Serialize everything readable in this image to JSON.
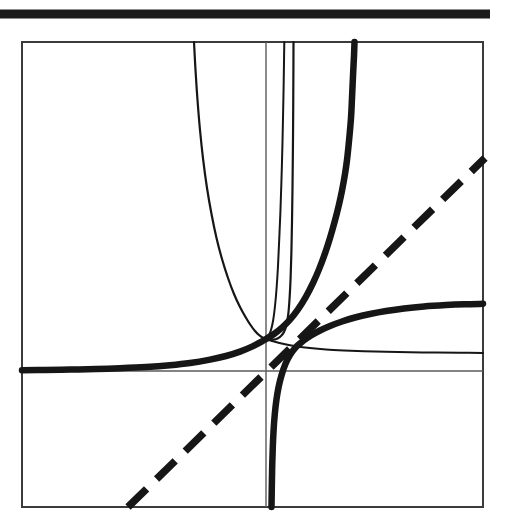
{
  "figure": {
    "title": "",
    "background_color": "#ffffff",
    "ink_color": "#161616",
    "axis_color": "#5a5a5a",
    "frame_color": "#3b3b3b",
    "top_rule": {
      "name": "top-rule",
      "x1": 0,
      "y1": 14,
      "x2": 490,
      "y2": 14,
      "stroke_width": 9,
      "color": "#1c1c1c"
    },
    "plot_frame": {
      "name": "plot-frame",
      "x": 22,
      "y": 42,
      "width": 461,
      "height": 465,
      "stroke_width": 2,
      "color": "#3b3b3b"
    },
    "axes": {
      "x_axis": {
        "y": 371,
        "x1": 22,
        "x2": 483,
        "stroke_width": 1.4,
        "color": "#5a5a5a"
      },
      "y_axis": {
        "x": 266,
        "y1": 42,
        "y2": 507,
        "stroke_width": 1.4,
        "color": "#5a5a5a"
      },
      "origin_px": [
        266,
        371
      ]
    }
  },
  "chart_data": {
    "type": "line",
    "title": "",
    "xlabel": "",
    "ylabel": "",
    "xlim": [
      -4.9,
      4.6
    ],
    "ylim": [
      -2.8,
      6.7
    ],
    "grid": false,
    "legend": false,
    "scale": {
      "px_per_x": 48,
      "px_per_y": 48,
      "origin_px": [
        266,
        371
      ]
    },
    "annotations": [
      "all curves pass through the common point (0, 1)",
      "dashed diagonal is the identity line y = x",
      "thick curve with vertical asymptote at x = 0 is a logarithm-type branch"
    ],
    "series": [
      {
        "name": "exp-thick-rising",
        "label": "y = e^x",
        "style": "solid",
        "width": "thick",
        "stroke_width": 6.5,
        "color": "#161616",
        "points_px": [
          [
            22,
            370.2
          ],
          [
            44,
            370.0
          ],
          [
            70,
            369.6
          ],
          [
            96,
            369.0
          ],
          [
            120,
            368.2
          ],
          [
            146,
            367.0
          ],
          [
            170,
            365.2
          ],
          [
            190,
            363.0
          ],
          [
            210,
            359.6
          ],
          [
            226,
            356.0
          ],
          [
            240,
            351.6
          ],
          [
            252,
            346.6
          ],
          [
            262,
            341.4
          ],
          [
            266,
            339.0
          ],
          [
            274,
            334.0
          ],
          [
            282,
            327.6
          ],
          [
            290,
            319.6
          ],
          [
            298,
            309.4
          ],
          [
            306,
            296.6
          ],
          [
            313,
            283.0
          ],
          [
            319,
            269.4
          ],
          [
            325,
            253.4
          ],
          [
            330,
            238.0
          ],
          [
            335,
            220.4
          ],
          [
            339,
            204.4
          ],
          [
            342,
            190.6
          ],
          [
            345,
            174.0
          ],
          [
            347,
            160.0
          ],
          [
            349,
            141.0
          ],
          [
            351,
            118.0
          ],
          [
            352,
            98.0
          ],
          [
            353,
            76.0
          ],
          [
            354,
            56.0
          ],
          [
            354.5,
            42.0
          ]
        ]
      },
      {
        "name": "log-thick-rising",
        "label": "y = ln(x) + 1",
        "style": "solid",
        "width": "thick",
        "stroke_width": 6.5,
        "color": "#161616",
        "points_px": [
          [
            271.5,
            507
          ],
          [
            271.8,
            488
          ],
          [
            272.2,
            466
          ],
          [
            272.8,
            447
          ],
          [
            273.6,
            430
          ],
          [
            274.8,
            414
          ],
          [
            276.4,
            400
          ],
          [
            278.6,
            387
          ],
          [
            281.6,
            375
          ],
          [
            285.4,
            364
          ],
          [
            290.0,
            355
          ],
          [
            296.0,
            347
          ],
          [
            303.0,
            341
          ],
          [
            311.0,
            335.5
          ],
          [
            320.0,
            330.5
          ],
          [
            330.0,
            326.0
          ],
          [
            342.0,
            321.5
          ],
          [
            355.0,
            317.5
          ],
          [
            370.0,
            314.0
          ],
          [
            386.0,
            311.0
          ],
          [
            404.0,
            308.4
          ],
          [
            424.0,
            306.4
          ],
          [
            446.0,
            305.0
          ],
          [
            465.0,
            304.2
          ],
          [
            483.0,
            303.8
          ]
        ]
      },
      {
        "name": "parabola-thin-u",
        "label": "thin U-shaped curve (even power / cosh-type)",
        "style": "solid",
        "width": "thin",
        "stroke_width": 2.2,
        "color": "#161616",
        "points_px": [
          [
            194,
            42
          ],
          [
            195.5,
            70
          ],
          [
            197.5,
            100
          ],
          [
            200.0,
            130
          ],
          [
            203.2,
            160
          ],
          [
            207.0,
            188
          ],
          [
            211.5,
            214
          ],
          [
            216.5,
            238
          ],
          [
            222.0,
            259
          ],
          [
            228.0,
            278
          ],
          [
            234.0,
            294
          ],
          [
            240.0,
            307
          ],
          [
            245.5,
            317
          ],
          [
            250.5,
            325
          ],
          [
            255.0,
            331
          ],
          [
            259.0,
            335
          ],
          [
            262.5,
            337.5
          ],
          [
            266,
            339
          ],
          [
            269.5,
            339.8
          ],
          [
            273.5,
            339.6
          ],
          [
            277.5,
            338.4
          ],
          [
            281.0,
            336.0
          ],
          [
            284.0,
            332.0
          ],
          [
            286.5,
            325.0
          ],
          [
            288.3,
            314.0
          ],
          [
            289.6,
            298.0
          ],
          [
            290.6,
            278.0
          ],
          [
            291.4,
            252.0
          ],
          [
            292.0,
            222.0
          ],
          [
            292.5,
            188.0
          ],
          [
            292.9,
            150.0
          ],
          [
            293.2,
            110.0
          ],
          [
            293.4,
            72.0
          ],
          [
            293.5,
            42.0
          ]
        ]
      },
      {
        "name": "thin-steep-rising",
        "label": "thin steep rising curve",
        "style": "solid",
        "width": "thin",
        "stroke_width": 2.0,
        "color": "#161616",
        "points_px": [
          [
            266,
            339
          ],
          [
            268.5,
            336
          ],
          [
            271.0,
            330
          ],
          [
            273.2,
            320
          ],
          [
            275.0,
            306
          ],
          [
            276.6,
            288
          ],
          [
            278.0,
            266
          ],
          [
            279.2,
            240
          ],
          [
            280.4,
            212
          ],
          [
            281.4,
            182
          ],
          [
            282.3,
            150
          ],
          [
            283.0,
            118
          ],
          [
            283.6,
            88
          ],
          [
            284.0,
            62
          ],
          [
            284.3,
            42
          ]
        ]
      },
      {
        "name": "thin-flat-decaying",
        "label": "thin slowly-rising curve approaching a horizontal asymptote",
        "style": "solid",
        "width": "thin",
        "stroke_width": 2.0,
        "color": "#161616",
        "points_px": [
          [
            266,
            339
          ],
          [
            274,
            341.5
          ],
          [
            284,
            344.0
          ],
          [
            296,
            346.2
          ],
          [
            310,
            348.0
          ],
          [
            326,
            349.4
          ],
          [
            344,
            350.4
          ],
          [
            364,
            351.2
          ],
          [
            386,
            351.8
          ],
          [
            410,
            352.2
          ],
          [
            436,
            352.6
          ],
          [
            460,
            352.8
          ],
          [
            483,
            353.0
          ]
        ]
      },
      {
        "name": "identity-dashed",
        "label": "y = x",
        "style": "dashed",
        "width": "thick",
        "stroke_width": 7.5,
        "dash_pattern": "26 14",
        "color": "#161616",
        "points_px": [
          [
            128,
            507
          ],
          [
            485,
            158
          ]
        ]
      }
    ]
  }
}
